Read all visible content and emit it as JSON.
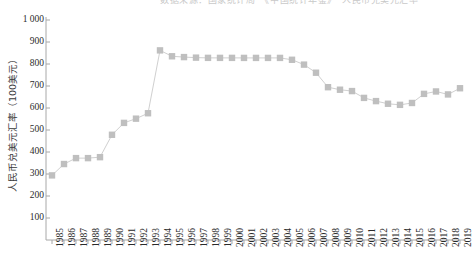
{
  "top_banner": {
    "text": "数据来源：国家统计局　《中国统计年鉴》　人民币兑美元汇率"
  },
  "axis": {
    "y_title": "人民币兑美元汇率（100美元）",
    "y_ticks": [
      "1 000",
      "900",
      "800",
      "700",
      "600",
      "500",
      "400",
      "300",
      "200",
      "100"
    ],
    "x_ticks": [
      "1985",
      "1986",
      "1987",
      "1988",
      "1989",
      "1990",
      "1991",
      "1992",
      "1993",
      "1994",
      "1995",
      "1996",
      "1997",
      "1998",
      "1999",
      "2000",
      "2001",
      "2002",
      "2003",
      "2004",
      "2005",
      "2006",
      "2007",
      "2008",
      "2009",
      "2010",
      "2011",
      "2012",
      "2013",
      "2014",
      "2015",
      "2016",
      "2017",
      "2018",
      "2019"
    ]
  },
  "colors": {
    "marker": "#bfbfbf",
    "line": "#d0d0d0",
    "axis": "#a8a8a8",
    "text": "#2b2b2b"
  },
  "chart_data": {
    "type": "line",
    "title": "",
    "subtitle": "",
    "xlabel": "",
    "ylabel": "人民币兑美元汇率（100美元）",
    "ylim": [
      0,
      1000
    ],
    "ytick_values": [
      0,
      100,
      200,
      300,
      400,
      500,
      600,
      700,
      800,
      900,
      1000
    ],
    "grid": false,
    "legend": null,
    "marker": "square",
    "categories": [
      "1985",
      "1986",
      "1987",
      "1988",
      "1989",
      "1990",
      "1991",
      "1992",
      "1993",
      "1994",
      "1995",
      "1996",
      "1997",
      "1998",
      "1999",
      "2000",
      "2001",
      "2002",
      "2003",
      "2004",
      "2005",
      "2006",
      "2007",
      "2008",
      "2009",
      "2010",
      "2011",
      "2012",
      "2013",
      "2014",
      "2015",
      "2016",
      "2017",
      "2018",
      "2019"
    ],
    "series": [
      {
        "name": "人民币兑美元汇率（100美元）",
        "values": [
          293.7,
          345.3,
          372.2,
          372.2,
          376.5,
          478.3,
          532.3,
          551.5,
          576.2,
          861.9,
          835.1,
          831.4,
          828.9,
          827.9,
          827.8,
          827.8,
          827.7,
          827.7,
          827.7,
          827.7,
          819.2,
          797.2,
          760.4,
          694.5,
          683.1,
          676.9,
          645.9,
          631.3,
          619.3,
          614.3,
          622.8,
          664.2,
          675.2,
          661.7,
          689.8
        ]
      }
    ]
  }
}
